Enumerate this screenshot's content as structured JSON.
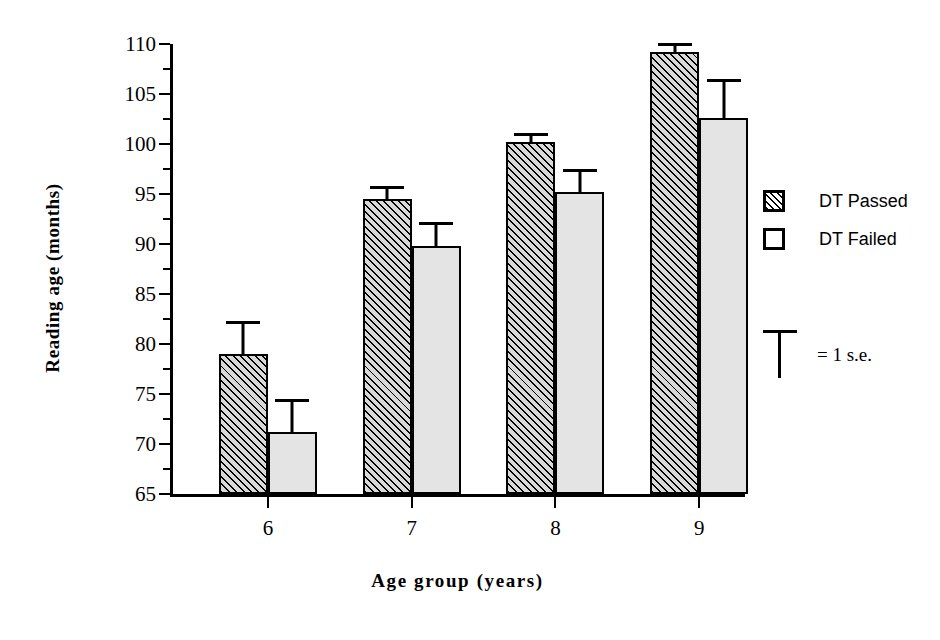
{
  "chart_data": {
    "type": "bar",
    "title": "",
    "xlabel": "Age group (years)",
    "ylabel": "Reading age (months)",
    "categories": [
      "6",
      "7",
      "8",
      "9"
    ],
    "ylim": [
      65,
      110
    ],
    "ytick_major": [
      65,
      70,
      75,
      80,
      85,
      90,
      95,
      100,
      105,
      110
    ],
    "ytick_minor": [
      67.5,
      72.5,
      77.5,
      82.5,
      87.5,
      92.5,
      97.5,
      102.5,
      107.5
    ],
    "grid": false,
    "legend_position": "right",
    "error_bar_note": "= 1 s.e.",
    "series": [
      {
        "name": "DT Passed",
        "fill": "hatched",
        "values": [
          79.0,
          94.5,
          100.2,
          109.2
        ],
        "errors": [
          3.3,
          1.3,
          0.9,
          0.9
        ]
      },
      {
        "name": "DT Failed",
        "fill": "light-gray",
        "values": [
          71.2,
          89.8,
          95.2,
          102.6
        ],
        "errors": [
          3.3,
          2.4,
          2.3,
          3.9
        ]
      }
    ]
  },
  "legend": {
    "items": [
      {
        "label": "DT Passed",
        "swatch": "hatched-swatch"
      },
      {
        "label": "DT Failed",
        "swatch": "empty-swatch"
      }
    ]
  },
  "se_key": {
    "label": "= 1 s.e.",
    "marker": "error-bar-icon"
  },
  "colors": {
    "axis": "#000000",
    "passed_fill": "#d8d8d8",
    "failed_fill": "#e4e4e4",
    "text": "#000000"
  }
}
